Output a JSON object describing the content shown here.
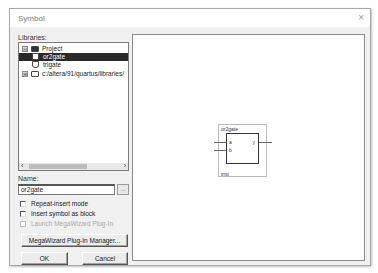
{
  "window": {
    "title": "Symbol",
    "close_glyph": "×"
  },
  "libraries": {
    "label": "Libraries:",
    "tree": [
      {
        "label": "Project",
        "expander": "⊟",
        "icon": "folder-open-icon",
        "level": 0,
        "selected": false
      },
      {
        "label": "or2gate",
        "icon": "symbol-icon",
        "level": 1,
        "selected": true
      },
      {
        "label": "trigate",
        "icon": "symbol-icon",
        "level": 1,
        "selected": false
      },
      {
        "label": "c:/altera/91/quartus/libraries/",
        "expander": "⊞",
        "icon": "folder-icon",
        "level": 0,
        "selected": false
      }
    ],
    "scroll_left": "‹",
    "scroll_right": "›"
  },
  "name": {
    "label": "Name:",
    "value": "or2gate",
    "browse_label": "..."
  },
  "options": [
    {
      "label": "Repeat-insert mode",
      "checked": false,
      "enabled": true
    },
    {
      "label": "Insert symbol as block",
      "checked": false,
      "enabled": true
    },
    {
      "label": "Launch MegaWizard Plug-In",
      "checked": false,
      "enabled": false
    }
  ],
  "buttons": {
    "megawizard": "MegaWizard Plug-In Manager...",
    "ok": "OK",
    "cancel": "Cancel"
  },
  "preview": {
    "symbol_name": "or2gate",
    "inputs": [
      "a",
      "b"
    ],
    "output": "y",
    "instance": "inst"
  }
}
